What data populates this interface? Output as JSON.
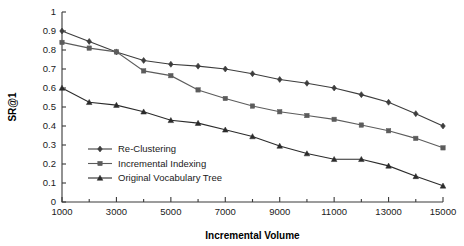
{
  "chart_data": {
    "type": "line",
    "title": "",
    "xlabel": "Incremental Volume",
    "ylabel": "SR@1",
    "xlim": [
      1000,
      15000
    ],
    "ylim": [
      0,
      1
    ],
    "grid": false,
    "legend_position": "lower-left-inside",
    "x": [
      1000,
      2000,
      3000,
      4000,
      5000,
      6000,
      7000,
      8000,
      9000,
      10000,
      11000,
      12000,
      13000,
      14000,
      15000
    ],
    "xticks_major": [
      "1000",
      "3000",
      "5000",
      "7000",
      "9000",
      "11000",
      "13000",
      "15000"
    ],
    "yticks": [
      "0",
      "0.1",
      "0.2",
      "0.3",
      "0.4",
      "0.5",
      "0.6",
      "0.7",
      "0.8",
      "0.9",
      "1"
    ],
    "series": [
      {
        "name": "Re-Clustering",
        "marker": "diamond",
        "color": "#3d3d3d",
        "values": [
          0.9,
          0.845,
          0.79,
          0.745,
          0.725,
          0.715,
          0.7,
          0.675,
          0.645,
          0.625,
          0.6,
          0.565,
          0.525,
          0.465,
          0.4
        ]
      },
      {
        "name": "Incremental Indexing",
        "marker": "square",
        "color": "#5c5c5c",
        "values": [
          0.84,
          0.81,
          0.79,
          0.69,
          0.665,
          0.59,
          0.545,
          0.505,
          0.475,
          0.455,
          0.435,
          0.405,
          0.375,
          0.335,
          0.285
        ]
      },
      {
        "name": "Original Vocabulary Tree",
        "marker": "triangle",
        "color": "#2b2b2b",
        "values": [
          0.6,
          0.525,
          0.51,
          0.475,
          0.43,
          0.415,
          0.38,
          0.345,
          0.295,
          0.255,
          0.225,
          0.225,
          0.19,
          0.135,
          0.085
        ]
      }
    ]
  }
}
